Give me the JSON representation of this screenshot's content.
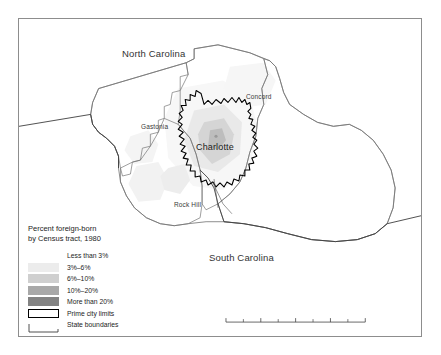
{
  "figure": {
    "kind": "thematic-choropleth-map",
    "region": "Charlotte metropolitan area, North Carolina / South Carolina"
  },
  "map": {
    "state_labels": [
      {
        "name": "north-carolina",
        "text": "North Carolina"
      },
      {
        "name": "south-carolina",
        "text": "South Carolina"
      }
    ],
    "city_labels": [
      {
        "name": "gastonia",
        "text": "Gastonia"
      },
      {
        "name": "concord",
        "text": "Concord"
      },
      {
        "name": "rock-hill",
        "text": "Rock Hill"
      }
    ],
    "primary_city": {
      "name": "charlotte",
      "text": "Charlotte"
    }
  },
  "legend": {
    "title_line1": "Percent foreign-born",
    "title_line2": "by Census tract, 1980",
    "classes": [
      {
        "label": "Less than 3%",
        "color": "#ffffff"
      },
      {
        "label": "3%–6%",
        "color": "#ececec"
      },
      {
        "label": "6%–10%",
        "color": "#cfcfcf"
      },
      {
        "label": "10%–20%",
        "color": "#a8a8a8"
      },
      {
        "label": "More than 20%",
        "color": "#838383"
      }
    ],
    "line_keys": [
      {
        "label": "Prime city limits",
        "style": "black-outline-box"
      },
      {
        "label": "State boundaries",
        "style": "thin-gray-line"
      }
    ]
  },
  "scalebar": {
    "ticks": [
      {
        "value": "0",
        "pos_pct": 0
      },
      {
        "value": "10",
        "pos_pct": 25
      },
      {
        "value": "20",
        "pos_pct": 50
      },
      {
        "value": "40",
        "pos_pct": 100
      }
    ],
    "units_label": "40 miles",
    "max_value": 40
  },
  "north_arrow": {
    "letter": "N"
  },
  "colors": {
    "frame": "#8d8d8d",
    "background": "#ffffff",
    "county_line": "#6f6f6f",
    "state_line": "#4a4a4a",
    "city_limits": "#000000",
    "text": "#1d1d1d"
  }
}
